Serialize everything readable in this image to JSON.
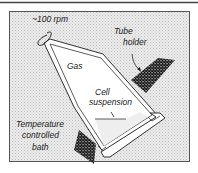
{
  "figure": {
    "labels": {
      "speed": "~100 rpm",
      "tube_holder_line1": "Tube",
      "tube_holder_line2": "holder",
      "gas": "Gas",
      "cell_line1": "Cell",
      "cell_line2": "suspension",
      "bath_line1": "Temperature",
      "bath_line2": "controlled",
      "bath_line3": "bath"
    },
    "colors": {
      "rule": "#444444",
      "panel_border": "#555555",
      "panel_fill": "#e4e4e4",
      "hatch": "#222222",
      "tube_fill": "#ffffff",
      "stroke": "#333333"
    }
  }
}
